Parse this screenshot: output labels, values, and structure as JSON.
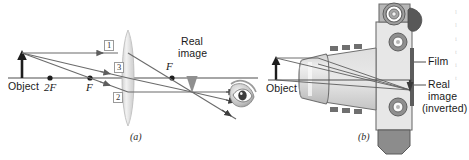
{
  "figure": {
    "kind": "optics-ray-diagram",
    "width": 469,
    "height": 160,
    "background": "#ffffff",
    "ink_color": "#1a1a1a",
    "ray_color": "#6b6b6b",
    "axis_color": "#555555"
  },
  "panel_a": {
    "caption": "(a)",
    "object_label": "Object",
    "two_f_label": "2F",
    "near_f_label": "F",
    "far_f_label": "F",
    "real_image_line1": "Real",
    "real_image_line2": "image",
    "ray_labels": [
      "1",
      "3",
      "2"
    ],
    "elements": {
      "lens": "converging-lens",
      "eye": "observer-eye",
      "axis": "optical-axis"
    }
  },
  "panel_b": {
    "caption": "(b)",
    "object_label": "Object",
    "film_label": "Film",
    "real_image_line1": "Real",
    "real_image_line2": "image",
    "real_image_line3": "(inverted)",
    "elements": {
      "camera": "camera-cross-section",
      "lens": "camera-lens-barrel",
      "film_plane": "film-plane",
      "viewfinder": "viewfinder-knob",
      "wind_lever": "film-advance-lever"
    }
  },
  "colors": {
    "body_light": "#e8e8e8",
    "body_mid": "#c9c9c9",
    "body_dark": "#8d8d8d",
    "body_darkest": "#6a6a6a",
    "lens_tint": "#dedede",
    "outline": "#5a5a5a"
  },
  "margin_text": {
    "fragments": [
      "l",
      "l",
      "i",
      "t",
      "i",
      "t"
    ]
  }
}
